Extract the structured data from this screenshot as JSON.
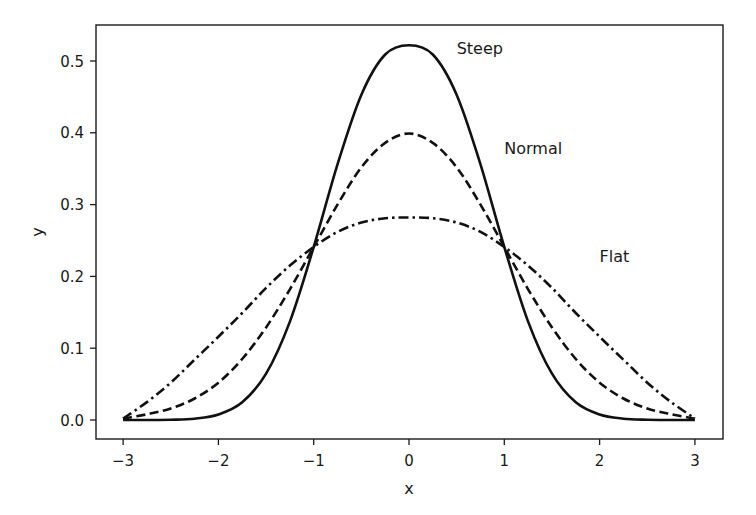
{
  "chart_data": {
    "type": "line",
    "title": "",
    "xlabel": "x",
    "ylabel": "y",
    "xlim": [
      -3.3,
      3.3
    ],
    "ylim": [
      -0.026,
      0.551
    ],
    "grid": false,
    "legend": null,
    "xticks": [
      -3,
      -2,
      -1,
      0,
      1,
      2,
      3
    ],
    "xtick_labels": [
      "−3",
      "−2",
      "−1",
      "0",
      "1",
      "2",
      "3"
    ],
    "yticks": [
      0.0,
      0.1,
      0.2,
      0.3,
      0.4,
      0.5
    ],
    "ytick_labels": [
      "0.0",
      "0.1",
      "0.2",
      "0.3",
      "0.4",
      "0.5"
    ],
    "x": [
      -3,
      -2.75,
      -2.5,
      -2.25,
      -2,
      -1.75,
      -1.5,
      -1.25,
      -1,
      -0.75,
      -0.5,
      -0.25,
      0,
      0.25,
      0.5,
      0.75,
      1,
      1.25,
      1.5,
      1.75,
      2,
      2.25,
      2.5,
      2.75,
      3
    ],
    "series": [
      {
        "name": "Steep",
        "style": "solid",
        "values": [
          0.0,
          0.0,
          0.0004,
          0.0018,
          0.0076,
          0.0247,
          0.0645,
          0.137,
          0.241,
          0.356,
          0.453,
          0.509,
          0.522,
          0.509,
          0.453,
          0.356,
          0.241,
          0.137,
          0.0645,
          0.0247,
          0.0076,
          0.0018,
          0.0004,
          0.0,
          0.0
        ]
      },
      {
        "name": "Normal",
        "style": "dashed",
        "values": [
          0.002,
          0.008,
          0.016,
          0.03,
          0.052,
          0.085,
          0.129,
          0.182,
          0.241,
          0.3,
          0.352,
          0.386,
          0.399,
          0.386,
          0.352,
          0.3,
          0.241,
          0.182,
          0.129,
          0.085,
          0.052,
          0.03,
          0.016,
          0.008,
          0.002
        ]
      },
      {
        "name": "Flat",
        "style": "dashdot",
        "values": [
          0.002,
          0.025,
          0.052,
          0.084,
          0.116,
          0.149,
          0.184,
          0.215,
          0.241,
          0.262,
          0.275,
          0.281,
          0.282,
          0.281,
          0.275,
          0.262,
          0.241,
          0.215,
          0.184,
          0.149,
          0.116,
          0.084,
          0.052,
          0.025,
          0.002
        ]
      }
    ],
    "annotations": [
      {
        "text": "Steep",
        "x": 0.5,
        "y": 0.51
      },
      {
        "text": "Normal",
        "x": 1.0,
        "y": 0.37
      },
      {
        "text": "Flat",
        "x": 2.0,
        "y": 0.22
      }
    ]
  }
}
